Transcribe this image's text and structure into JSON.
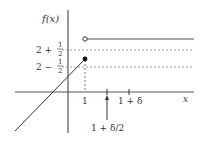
{
  "diagram": {
    "y_axis_label": "f(x)",
    "x_axis_label": "x",
    "y_ticks": [
      {
        "label_main": "2 +",
        "frac_num": "1",
        "frac_den": "2"
      },
      {
        "label_main": "2 −",
        "frac_num": "1",
        "frac_den": "2"
      }
    ],
    "x_ticks": [
      "1",
      "1 + δ"
    ],
    "annotation": "1 + δ/2",
    "colors": {
      "line": "#333333",
      "dashed": "#888888",
      "axis": "#333333"
    }
  }
}
